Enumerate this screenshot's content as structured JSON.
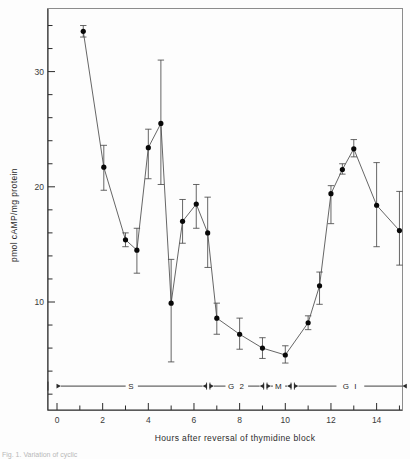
{
  "figure": {
    "caption_fragment": "Fig. 1. Variation of cyclic"
  },
  "chart_data": {
    "type": "scatter",
    "title": "",
    "subtitle": "",
    "xlabel": "Hours after  reversal of  thymidine  block",
    "ylabel": "pmol cAMP/mg protein",
    "xlim": [
      0,
      15.5
    ],
    "ylim": [
      0,
      35.5
    ],
    "xticks": [
      0,
      2,
      4,
      6,
      8,
      10,
      12,
      14
    ],
    "xticklabels": [
      "0",
      "2",
      "4",
      "6",
      "8",
      "10",
      "12",
      "14"
    ],
    "xminor_step": 1,
    "yticks": [
      10,
      20,
      30
    ],
    "yticklabels": [
      "10",
      "20",
      "30"
    ],
    "yminor_step": 2,
    "grid": false,
    "legend": "none",
    "connected": true,
    "marker": "filled-circle",
    "errorbars": "asymmetric",
    "x": [
      1.15,
      2.05,
      3.0,
      3.5,
      4.0,
      4.55,
      5.0,
      5.5,
      6.1,
      6.6,
      7.0,
      8.0,
      9.0,
      10.0,
      11.0,
      11.5,
      12.0,
      12.5,
      13.0,
      14.0,
      15.0
    ],
    "values": [
      33.5,
      21.7,
      15.4,
      14.5,
      23.4,
      25.5,
      9.9,
      17.0,
      18.5,
      16.0,
      8.6,
      7.2,
      6.0,
      5.4,
      8.2,
      11.4,
      19.4,
      21.5,
      23.3,
      18.4,
      16.2
    ],
    "err_low": [
      33.0,
      19.7,
      14.8,
      12.5,
      20.7,
      20.2,
      4.8,
      15.1,
      16.4,
      13.0,
      7.2,
      5.9,
      5.1,
      4.7,
      7.6,
      9.8,
      16.8,
      21.1,
      22.6,
      14.8,
      13.2
    ],
    "err_high": [
      34.0,
      23.6,
      16.0,
      16.4,
      25.0,
      31.0,
      13.7,
      18.9,
      20.2,
      19.1,
      9.9,
      8.6,
      6.9,
      6.2,
      8.8,
      12.6,
      20.1,
      22.0,
      24.1,
      22.1,
      19.6
    ],
    "phase_bar": {
      "y_value": 2.7,
      "segments": [
        {
          "label": "S",
          "x_start": 0.0,
          "x_end": 6.55
        },
        {
          "label": "G 2",
          "x_start": 6.7,
          "x_end": 9.05
        },
        {
          "label": "M",
          "x_start": 9.2,
          "x_end": 10.25
        },
        {
          "label": "G  I",
          "x_start": 10.4,
          "x_end": 15.3
        }
      ]
    }
  }
}
